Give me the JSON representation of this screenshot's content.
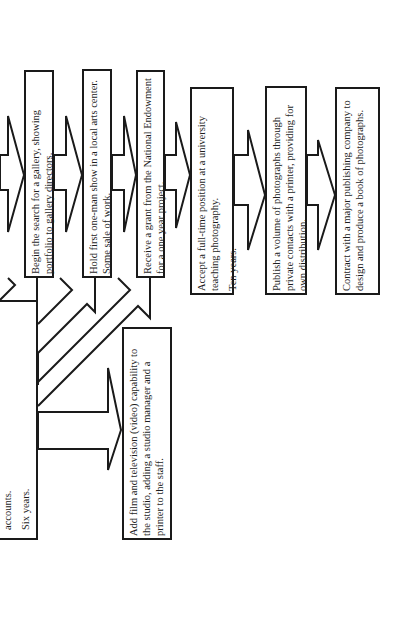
{
  "diagram": {
    "orientation": "rotated-90-counterclockwise",
    "colors": {
      "line": "#1a1a1a",
      "text": "#1e1e1e",
      "background": "#ffffff"
    },
    "left_box": {
      "lines": [
        "accounts.",
        "Six years."
      ]
    },
    "branch_box": {
      "text": "Add film and television (video) capability to the studio, adding a studio manager and a printer to the staff."
    },
    "steps": [
      {
        "text": "Begin the search for a gallery, showing portfolio to gallery directors."
      },
      {
        "text": "Hold first one-man show in a local arts center. Some sale of work."
      },
      {
        "text": "Receive a grant from the National Endowment for a one year project."
      },
      {
        "text": "Accept a full-time position at a university teaching photography.",
        "duration": "Ten years."
      },
      {
        "text": "Publish a volume of photographs through private contacts with a printer, providing for own distribution."
      },
      {
        "text": "Contract with a major publishing company to design and produce a book of photographs."
      }
    ]
  }
}
